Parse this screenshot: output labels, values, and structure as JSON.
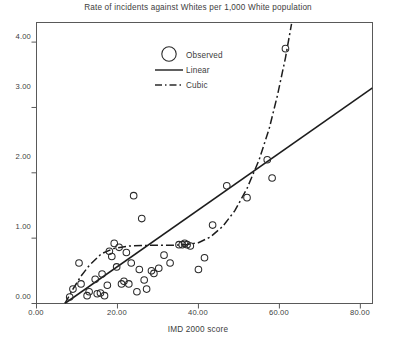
{
  "chart_data": {
    "type": "scatter",
    "title": "Rate of incidents against Whites per 1,000 White population",
    "xlabel": "IMD 2000 score",
    "ylabel": "",
    "xlim": [
      0,
      83
    ],
    "ylim": [
      0,
      4.3
    ],
    "xticks": [
      0,
      20,
      40,
      60,
      80
    ],
    "xtick_labels": [
      "0.00",
      "20.00",
      "40.00",
      "60.00",
      "80.00"
    ],
    "yticks": [
      0,
      1,
      2,
      3,
      4
    ],
    "ytick_labels": [
      "0.00",
      "1.00",
      "2.00",
      "3.00",
      "4.00"
    ],
    "grid": false,
    "legend_position": "upper-left-inside",
    "legend": [
      {
        "key": "observed",
        "label": "Observed",
        "marker": "circle"
      },
      {
        "key": "linear",
        "label": "Linear",
        "marker": "solid-line"
      },
      {
        "key": "cubic",
        "label": "Cubic",
        "marker": "dash-dot-line"
      }
    ],
    "series": [
      {
        "name": "Observed",
        "type": "scatter",
        "marker": "open-circle",
        "points": [
          [
            8.2,
            0.1
          ],
          [
            9.0,
            0.22
          ],
          [
            10.5,
            0.62
          ],
          [
            11.0,
            0.3
          ],
          [
            12.5,
            0.12
          ],
          [
            13.0,
            0.18
          ],
          [
            14.5,
            0.37
          ],
          [
            15.0,
            0.15
          ],
          [
            15.8,
            0.16
          ],
          [
            16.2,
            0.45
          ],
          [
            16.8,
            0.12
          ],
          [
            17.5,
            0.28
          ],
          [
            18.0,
            0.8
          ],
          [
            18.6,
            0.72
          ],
          [
            19.2,
            0.92
          ],
          [
            19.8,
            0.56
          ],
          [
            20.4,
            0.86
          ],
          [
            21.0,
            0.3
          ],
          [
            21.6,
            0.34
          ],
          [
            22.2,
            0.78
          ],
          [
            22.8,
            0.3
          ],
          [
            23.4,
            0.62
          ],
          [
            24.0,
            1.65
          ],
          [
            24.8,
            0.18
          ],
          [
            25.4,
            0.52
          ],
          [
            26.0,
            1.3
          ],
          [
            26.6,
            0.36
          ],
          [
            27.2,
            0.22
          ],
          [
            28.4,
            0.5
          ],
          [
            29.0,
            0.46
          ],
          [
            30.2,
            0.54
          ],
          [
            31.5,
            0.74
          ],
          [
            33.0,
            0.62
          ],
          [
            35.2,
            0.9
          ],
          [
            36.0,
            0.9
          ],
          [
            36.6,
            0.92
          ],
          [
            37.2,
            0.9
          ],
          [
            38.0,
            0.88
          ],
          [
            40.0,
            0.52
          ],
          [
            41.5,
            0.7
          ],
          [
            43.5,
            1.2
          ],
          [
            47.0,
            1.8
          ],
          [
            52.0,
            1.62
          ],
          [
            57.0,
            2.2
          ],
          [
            58.2,
            1.92
          ],
          [
            61.5,
            3.9
          ]
        ]
      },
      {
        "name": "Linear",
        "type": "line",
        "style": "solid",
        "points": [
          [
            7.0,
            0.0
          ],
          [
            83.0,
            3.3
          ]
        ]
      },
      {
        "name": "Cubic",
        "type": "line",
        "style": "dash-dot",
        "points": [
          [
            7.0,
            0.0
          ],
          [
            9.0,
            0.22
          ],
          [
            11.0,
            0.42
          ],
          [
            13.0,
            0.58
          ],
          [
            16.0,
            0.76
          ],
          [
            19.0,
            0.84
          ],
          [
            23.0,
            0.88
          ],
          [
            28.0,
            0.89
          ],
          [
            33.0,
            0.89
          ],
          [
            37.0,
            0.9
          ],
          [
            40.0,
            0.93
          ],
          [
            43.0,
            1.02
          ],
          [
            46.0,
            1.18
          ],
          [
            49.0,
            1.42
          ],
          [
            52.0,
            1.76
          ],
          [
            55.0,
            2.2
          ],
          [
            57.5,
            2.68
          ],
          [
            59.5,
            3.18
          ],
          [
            61.5,
            3.76
          ],
          [
            63.0,
            4.28
          ]
        ]
      }
    ]
  },
  "axes": {
    "frame_color": "#555555",
    "ink_color": "#2b2b2b"
  }
}
